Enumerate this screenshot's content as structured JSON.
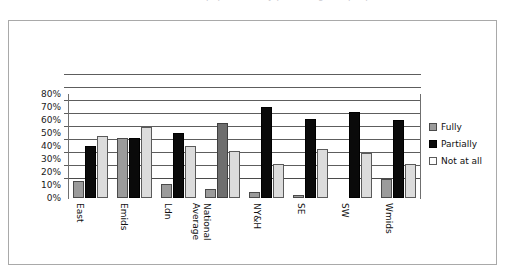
{
  "page": {
    "cutoff_text_top": "population, by percentage, of people."
  },
  "legend": {
    "position": "right",
    "items": [
      {
        "label": "Fully",
        "color": "#9b9b9b",
        "icon": "square-swatch-gray"
      },
      {
        "label": "Partially",
        "color": "#0a0a0a",
        "icon": "square-swatch-black"
      },
      {
        "label": "Not at all",
        "color": "#fdfdfd",
        "icon": "square-swatch-white"
      }
    ]
  },
  "axis": {
    "y_ticks": [
      "80%",
      "70%",
      "60%",
      "50%",
      "40%",
      "30%",
      "20%",
      "10%",
      "0%"
    ],
    "y_values": [
      80,
      70,
      60,
      50,
      40,
      30,
      20,
      10,
      0
    ]
  },
  "categories_display": [
    {
      "line1": "East",
      "line2": ""
    },
    {
      "line1": "Emids",
      "line2": ""
    },
    {
      "line1": "Ldn",
      "line2": ""
    },
    {
      "line1": "National",
      "line2": "Average"
    },
    {
      "line1": "NY&H",
      "line2": ""
    },
    {
      "line1": "SE",
      "line2": ""
    },
    {
      "line1": "SW",
      "line2": ""
    },
    {
      "line1": "Wmids",
      "line2": ""
    }
  ],
  "chart_data": {
    "type": "bar",
    "title": "",
    "subtitle": "",
    "xlabel": "",
    "ylabel": "",
    "ylim": [
      0,
      80
    ],
    "ytick_step": 10,
    "grid": true,
    "legend_position": "right",
    "categories": [
      "East",
      "Emids",
      "Ldn",
      "National Average",
      "NY&H",
      "SE",
      "SW",
      "Wmids"
    ],
    "series": [
      {
        "name": "Fully",
        "color": "#9b9b9b",
        "values": [
          13,
          46,
          11,
          7,
          4.5,
          2,
          0,
          14.5
        ]
      },
      {
        "name": "Partially",
        "color": "#0a0a0a",
        "values": [
          40,
          46,
          50,
          58,
          70,
          61,
          66,
          60
        ]
      },
      {
        "name": "Not at all",
        "color": "#dcdcdc",
        "values": [
          48,
          55,
          40,
          36,
          26,
          37.5,
          34.5,
          26.5
        ]
      }
    ]
  }
}
